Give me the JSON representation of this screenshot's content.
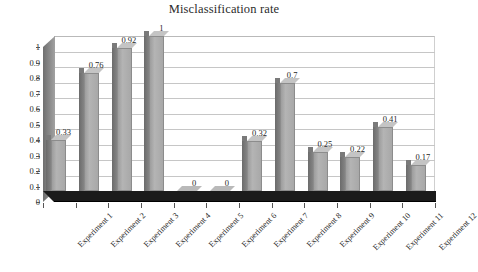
{
  "chart_data": {
    "type": "bar",
    "title": "Misclassification rate",
    "xlabel": "",
    "ylabel": "",
    "ylim": [
      0,
      1
    ],
    "ytick_labels": [
      "1",
      "0.9",
      "0.8",
      "0.7",
      "0.6",
      "0.5",
      "0.4",
      "0.3",
      "0.2",
      "0.1",
      "0"
    ],
    "ytick_values": [
      1,
      0.9,
      0.8,
      0.7,
      0.6,
      0.5,
      0.4,
      0.3,
      0.2,
      0.1,
      0
    ],
    "grid": true,
    "legend": false,
    "style": "3d-column",
    "bar_color": "#a8a8a8",
    "categories": [
      "Experiment 1",
      "Experiment 2",
      "Experiment 3",
      "Experiment 4",
      "Experiment 5",
      "Experiment 6",
      "Experiment 7",
      "Experiment 8",
      "Experiment 9",
      "Experiment 10",
      "Experiment 11",
      "Experiment 12"
    ],
    "values": [
      0.33,
      0.76,
      0.92,
      1,
      0,
      0,
      0.32,
      0.7,
      0.25,
      0.22,
      0.41,
      0.17
    ],
    "data_labels": [
      "0.33",
      "0.76",
      "0.92",
      "1",
      "0",
      "0",
      "0.32",
      "0.7",
      "0.25",
      "0.22",
      "0.41",
      "0.17"
    ]
  }
}
